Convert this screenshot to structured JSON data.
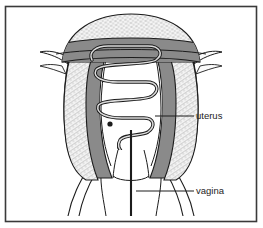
{
  "figure": {
    "kind": "anatomical-illustration",
    "view": "frontal coronal section",
    "frame": {
      "border_color": "#3a3a3a",
      "background_color": "#ffffff"
    },
    "palette": {
      "outline": "#1c1c1c",
      "hatched_tissue": "#f2f2f2",
      "dark_tissue": "#8a8a8a",
      "cavity": "#ffffff",
      "device_fill": "#d8d8d8",
      "label_color": "#1c1c1c",
      "leader_color": "#1c1c1c"
    },
    "labels": [
      {
        "id": "uterus",
        "text": "uterus",
        "text_x": 196,
        "text_y": 116,
        "leader_x1": 155,
        "leader_y1": 116,
        "leader_x2": 194,
        "leader_y2": 116
      },
      {
        "id": "vagina",
        "text": "vagina",
        "text_x": 196,
        "text_y": 191,
        "leader_x1": 136,
        "leader_y1": 191,
        "leader_x2": 194,
        "leader_y2": 191
      }
    ],
    "parts": [
      {
        "id": "fundus",
        "name": "uterine fundus"
      },
      {
        "id": "left-wall",
        "name": "left uterine wall"
      },
      {
        "id": "right-wall",
        "name": "right uterine wall"
      },
      {
        "id": "endometrial-cavity",
        "name": "endometrial cavity"
      },
      {
        "id": "cervical-canal",
        "name": "cervical canal"
      },
      {
        "id": "vaginal-canal",
        "name": "vaginal canal"
      },
      {
        "id": "coiled-device",
        "name": "coiled intrauterine device"
      },
      {
        "id": "left-ligament",
        "name": "left broad ligament"
      },
      {
        "id": "right-ligament",
        "name": "right broad ligament"
      }
    ]
  }
}
